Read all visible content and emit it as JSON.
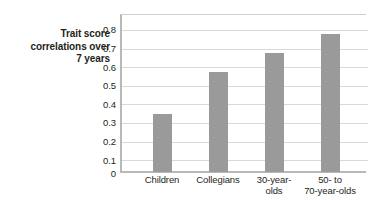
{
  "chart_data": {
    "type": "bar",
    "title": "",
    "xlabel": "",
    "ylabel": "Trait score correlations over 7 years",
    "categories": [
      "Children",
      "Collegians",
      "30-year-olds",
      "50- to 70-year-olds"
    ],
    "values": [
      0.31,
      0.54,
      0.64,
      0.74
    ],
    "ylim": [
      0,
      0.85
    ],
    "yticks": [
      0,
      0.1,
      0.2,
      0.3,
      0.4,
      0.5,
      0.6,
      0.7,
      0.8
    ],
    "ytick_labels": [
      "0",
      "0.1",
      "0.2",
      "0.3",
      "0.4",
      "0.5",
      "0.6",
      "0.7",
      "0.8"
    ],
    "grid": true,
    "legend": null,
    "bar_color": "#9a9a9a",
    "background_color": "#ffffff",
    "axis_color": "#b9b9b9",
    "grid_color": "#d8d8d8",
    "text_color": "#231f20"
  },
  "axis_title": {
    "line1": "Trait score",
    "line2": "correlations over",
    "line3": "7 years"
  },
  "xtick_labels": [
    {
      "line1": "Children",
      "line2": ""
    },
    {
      "line1": "Collegians",
      "line2": ""
    },
    {
      "line1": "30-year-",
      "line2": "olds"
    },
    {
      "line1": "50-  to",
      "line2": "70-year-olds"
    }
  ]
}
